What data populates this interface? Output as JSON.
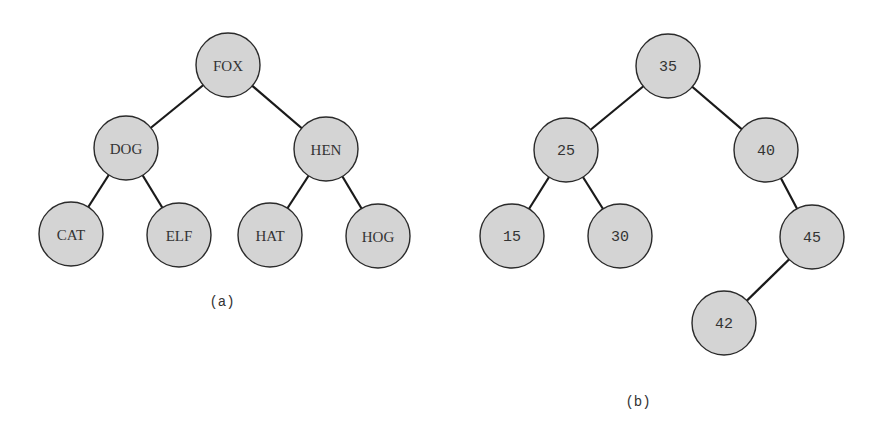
{
  "diagrams": [
    {
      "caption": "(a)",
      "caption_pos": [
        222,
        302
      ],
      "label_style": "serif",
      "nodes": [
        {
          "id": "fox",
          "label": "FOX",
          "x": 228,
          "y": 65
        },
        {
          "id": "dog",
          "label": "DOG",
          "x": 126,
          "y": 148
        },
        {
          "id": "hen",
          "label": "HEN",
          "x": 326,
          "y": 149
        },
        {
          "id": "cat",
          "label": "CAT",
          "x": 71,
          "y": 234
        },
        {
          "id": "elf",
          "label": "ELF",
          "x": 179,
          "y": 235
        },
        {
          "id": "hat",
          "label": "HAT",
          "x": 270,
          "y": 235
        },
        {
          "id": "hog",
          "label": "HOG",
          "x": 378,
          "y": 236
        }
      ],
      "edges": [
        [
          "fox",
          "dog"
        ],
        [
          "fox",
          "hen"
        ],
        [
          "dog",
          "cat"
        ],
        [
          "dog",
          "elf"
        ],
        [
          "hen",
          "hat"
        ],
        [
          "hen",
          "hog"
        ]
      ]
    },
    {
      "caption": "(b)",
      "caption_pos": [
        638,
        402
      ],
      "label_style": "mono",
      "nodes": [
        {
          "id": "n35",
          "label": "35",
          "x": 668,
          "y": 66
        },
        {
          "id": "n25",
          "label": "25",
          "x": 566,
          "y": 150
        },
        {
          "id": "n40",
          "label": "40",
          "x": 766,
          "y": 150
        },
        {
          "id": "n15",
          "label": "15",
          "x": 512,
          "y": 236
        },
        {
          "id": "n30",
          "label": "30",
          "x": 620,
          "y": 236
        },
        {
          "id": "n45",
          "label": "45",
          "x": 812,
          "y": 237
        },
        {
          "id": "n42",
          "label": "42",
          "x": 724,
          "y": 323
        }
      ],
      "edges": [
        [
          "n35",
          "n25"
        ],
        [
          "n35",
          "n40"
        ],
        [
          "n25",
          "n15"
        ],
        [
          "n25",
          "n30"
        ],
        [
          "n40",
          "n45"
        ],
        [
          "n45",
          "n42"
        ]
      ]
    }
  ],
  "style": {
    "node_radius": 32,
    "node_fill": "#d4d4d4",
    "node_stroke": "#2a2a2a",
    "edge_color": "#1a1a1a"
  }
}
